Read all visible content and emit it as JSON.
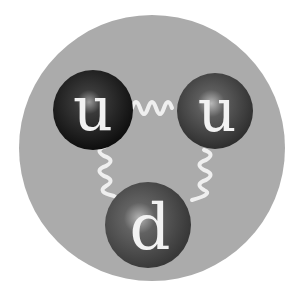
{
  "diagram": {
    "background_color": "#ababab",
    "gluon_color": "#efefef",
    "quarks": [
      {
        "label": "u",
        "cx": 93,
        "cy": 110,
        "r": 40,
        "color": "#1a1a1a"
      },
      {
        "label": "u",
        "cx": 215,
        "cy": 111,
        "r": 38,
        "color": "#4a4a4a"
      },
      {
        "label": "d",
        "cx": 148,
        "cy": 225,
        "r": 43,
        "color": "#555555"
      }
    ]
  }
}
